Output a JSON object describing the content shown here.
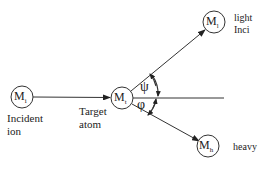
{
  "diagram": {
    "type": "collision-scattering",
    "colors": {
      "stroke": "#333333",
      "text": "#222222",
      "background": "#ffffff"
    },
    "nodes": {
      "incident": {
        "symbol": "M",
        "subscript": "i",
        "caption_line1": "Incident",
        "caption_line2": "ion"
      },
      "target": {
        "symbol": "M",
        "subscript": "t",
        "caption_line1": "Target",
        "caption_line2": "atom"
      },
      "light": {
        "symbol": "M",
        "subscript": "l",
        "caption_line1": "light",
        "caption_line2": "Inci"
      },
      "heavy": {
        "symbol": "M",
        "subscript": "h",
        "caption_line1": "heavy"
      }
    },
    "angles": {
      "upper": "ψ",
      "lower": "φ"
    }
  }
}
